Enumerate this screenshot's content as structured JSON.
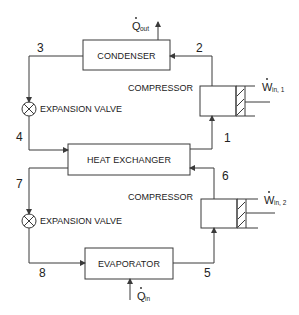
{
  "diagram": {
    "components": {
      "condenser": "CONDENSER",
      "heat_exchanger": "HEAT EXCHANGER",
      "evaporator": "EVAPORATOR",
      "compressor_top": "COMPRESSOR",
      "compressor_bottom": "COMPRESSOR",
      "valve_top": "EXPANSION VALVE",
      "valve_bottom": "EXPANSION VALVE"
    },
    "states": {
      "s1": "1",
      "s2": "2",
      "s3": "3",
      "s4": "4",
      "s5": "5",
      "s6": "6",
      "s7": "7",
      "s8": "8"
    },
    "energy": {
      "q_out_main": "Q",
      "q_out_sub": "out",
      "q_in_main": "Q",
      "q_in_sub": "in",
      "w_in1_main": "W",
      "w_in1_sub": "in, 1",
      "w_in2_main": "W",
      "w_in2_sub": "in, 2"
    },
    "colors": {
      "line": "#3a3a3a",
      "text": "#222222",
      "background": "#ffffff"
    }
  }
}
